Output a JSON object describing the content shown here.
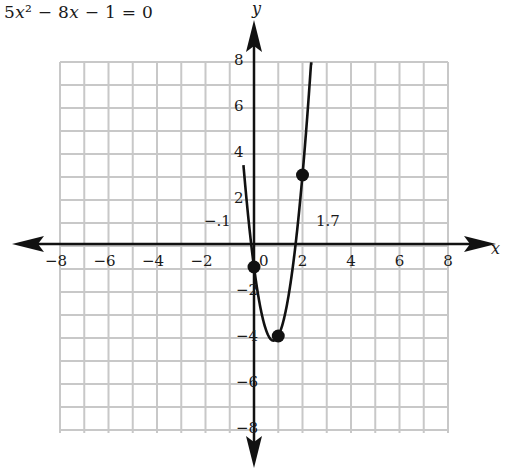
{
  "equation": {
    "text": "5x² − 8x − 1 = 0",
    "parts": [
      "5",
      "x",
      "² − 8",
      "x",
      " − 1 = 0"
    ]
  },
  "chart_data": {
    "type": "line",
    "title": "5x² − 8x − 1 = 0",
    "function": "y = 5x^2 - 8x - 1",
    "xlabel": "x",
    "ylabel": "y",
    "xlim": [
      -8,
      8
    ],
    "ylim": [
      -8,
      8
    ],
    "grid": true,
    "grid_step": 1,
    "x_ticks": [
      -8,
      -6,
      -4,
      -2,
      0,
      2,
      4,
      6,
      8
    ],
    "x_tick_labels": [
      "−8",
      "−6",
      "−4",
      "−2",
      "0",
      "2",
      "4",
      "6",
      "8"
    ],
    "y_ticks": [
      -8,
      -6,
      -4,
      -2,
      2,
      4,
      6,
      8
    ],
    "y_tick_labels": [
      "−8",
      "−6",
      "−4",
      "−2",
      "2",
      "4",
      "6",
      "8"
    ],
    "series": [
      {
        "name": "5x² − 8x − 1",
        "x": [
          -0.4,
          -0.3,
          -0.2,
          -0.1,
          0,
          0.2,
          0.4,
          0.6,
          0.8,
          1.0,
          1.2,
          1.4,
          1.6,
          1.8,
          2.0,
          2.2
        ],
        "y": [
          3.0,
          1.85,
          0.8,
          -0.15,
          -1,
          -2.4,
          -3.4,
          -4.0,
          -4.2,
          -4.0,
          -3.4,
          -2.4,
          -1.0,
          0.8,
          3.0,
          5.6
        ]
      }
    ],
    "points": [
      {
        "x": 0,
        "y": -1
      },
      {
        "x": 1,
        "y": -4
      },
      {
        "x": 2,
        "y": 3
      }
    ],
    "annotations": [
      {
        "text": "−.1",
        "x": -0.1,
        "y": 0,
        "meaning": "left root ≈ −0.1"
      },
      {
        "text": "1.7",
        "x": 1.7,
        "y": 0,
        "meaning": "right root ≈ 1.7"
      }
    ]
  }
}
